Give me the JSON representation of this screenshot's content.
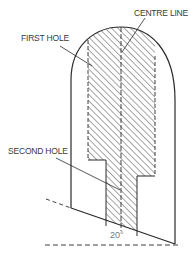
{
  "diagram": {
    "labels": {
      "centre_line": "CENTRE LINE",
      "first_hole": "FIRST HOLE",
      "second_hole": "SECOND HOLE",
      "angle": "20°"
    },
    "colors": {
      "line": "#2a2a2a",
      "hatch": "#3a3a3a",
      "label": "#3a3a3a",
      "angle_label": "#777777",
      "background": "#ffffff"
    }
  }
}
